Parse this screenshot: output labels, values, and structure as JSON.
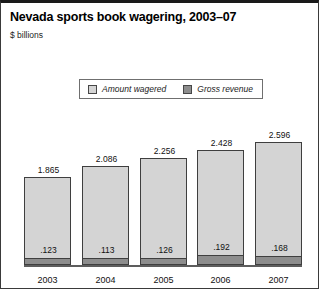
{
  "chart_data": {
    "type": "bar",
    "subtype": "overlapping-stacked",
    "title": "Nevada sports book wagering, 2003–07",
    "subtitle": "$ billions",
    "unit_label": "$ billions",
    "xlabel": "",
    "ylabel": "",
    "categories": [
      "2003",
      "2004",
      "2005",
      "2006",
      "2007"
    ],
    "series": [
      {
        "name": "Amount wagered",
        "color": "#d4d4d4",
        "values": [
          1.865,
          2.086,
          2.256,
          2.428,
          2.596
        ],
        "labels": [
          "1.865",
          "2.086",
          "2.256",
          "2.428",
          "2.596"
        ]
      },
      {
        "name": "Gross revenue",
        "color": "#8d8d8d",
        "values": [
          0.123,
          0.113,
          0.126,
          0.192,
          0.168
        ],
        "labels": [
          ".123",
          ".113",
          ".126",
          ".192",
          ".168"
        ]
      }
    ],
    "ylim": [
      0,
      2.75
    ],
    "grid": false,
    "legend_position": "top-center"
  },
  "legend": {
    "entries": [
      {
        "label": "Amount wagered",
        "swatch": "light-gray-swatch-icon"
      },
      {
        "label": "Gross revenue",
        "swatch": "dark-gray-swatch-icon"
      }
    ]
  },
  "colors": {
    "amount_wagered": "#d4d4d4",
    "gross_revenue": "#8d8d8d",
    "outline": "#3f3f3f",
    "axis": "#5d5d5d",
    "text": "#111111",
    "rule": "#1a1a1a"
  }
}
